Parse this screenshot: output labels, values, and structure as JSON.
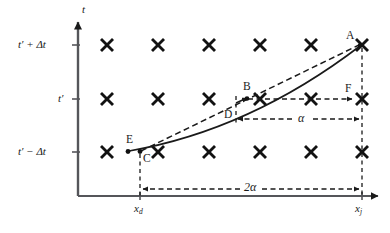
{
  "figure": {
    "type": "spacetime-grid-diagram",
    "background": "#ffffff",
    "ink_color": "#1a1a1a"
  },
  "axes": {
    "vertical": {
      "name": "t",
      "arrow": "up",
      "x_px": 78,
      "top_px": 18,
      "bottom_px": 196,
      "tick_labels": [
        {
          "text_html": "t′ + Δt",
          "y_px": 45
        },
        {
          "text_html": "t′",
          "y_px": 99
        },
        {
          "text_html": "t′ − Δt",
          "y_px": 152
        }
      ]
    },
    "horizontal": {
      "arrow": "right",
      "y_px": 196,
      "left_px": 78,
      "right_px": 382,
      "tick_labels": [
        {
          "base": "x",
          "subscript": "d",
          "x_px": 140,
          "y_px": 204
        },
        {
          "base": "x",
          "subscript": "j",
          "x_px": 352,
          "y_px": 204
        }
      ]
    }
  },
  "grid": {
    "marker": "cross-x",
    "marker_glyph": "×",
    "rows": 3,
    "columns": 6,
    "row_y_px": [
      45,
      99,
      152
    ],
    "col_x_px": [
      107,
      158,
      209,
      260,
      311,
      362
    ]
  },
  "points": [
    {
      "id": "A",
      "label": "A",
      "x_px": 362,
      "y_px": 45,
      "label_dx": -13,
      "label_dy": -12,
      "dot": true
    },
    {
      "id": "B",
      "label": "B",
      "x_px": 246,
      "y_px": 99,
      "label_dx": -2,
      "label_dy": -15,
      "dot": true
    },
    {
      "id": "C",
      "label": "C",
      "x_px": 140,
      "y_px": 152,
      "label_dx": 3,
      "label_dy": 4,
      "dot": true
    },
    {
      "id": "D",
      "label": "D",
      "x_px": 232,
      "y_px": 116,
      "label_dx": -9,
      "label_dy": -5,
      "dot": false
    },
    {
      "id": "E",
      "label": "E",
      "x_px": 128,
      "y_px": 152,
      "label_dx": -2,
      "label_dy": -15,
      "dot": true
    },
    {
      "id": "F",
      "label": "F",
      "x_px": 362,
      "y_px": 99,
      "label_dx": -14,
      "label_dy": -13,
      "dot": false
    }
  ],
  "trajectories": [
    {
      "name": "solid-curve",
      "style": "solid",
      "from": "E",
      "to": "A",
      "description": "curved characteristic from E through B toward A"
    },
    {
      "name": "dashed-chord",
      "style": "dashed",
      "from": "C",
      "to": "A",
      "description": "straight dashed chord from C to A"
    }
  ],
  "dimension_arrows": [
    {
      "name": "alpha",
      "label": "α",
      "label_x_px": 303,
      "label_y_px": 112,
      "y_px": 119,
      "from_x_px": 236,
      "to_x_px": 360,
      "double_headed": true,
      "style": "dashed"
    },
    {
      "name": "two-alpha",
      "label": "2α",
      "label_x_px": 250,
      "label_y_px": 182,
      "y_px": 189,
      "from_x_px": 141,
      "to_x_px": 360,
      "double_headed": true,
      "style": "dashed"
    }
  ],
  "guide_lines": [
    {
      "name": "vertical-xd-guide",
      "style": "dashed",
      "x_px": 140,
      "from_y_px": 152,
      "to_y_px": 196
    },
    {
      "name": "vertical-xj-guide",
      "style": "dashed",
      "x_px": 362,
      "from_y_px": 45,
      "to_y_px": 196
    },
    {
      "name": "vertical-D-guide",
      "style": "dashed",
      "x_px": 236,
      "from_y_px": 96,
      "to_y_px": 126
    },
    {
      "name": "horizontal-tprime-guide",
      "style": "dashed",
      "y_px": 99,
      "from_x_px": 248,
      "to_x_px": 358
    }
  ]
}
